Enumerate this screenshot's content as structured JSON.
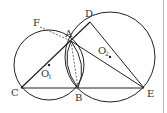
{
  "diagram": {
    "type": "geometry",
    "points": {
      "A": {
        "label": "A",
        "x": 71,
        "y": 41
      },
      "B": {
        "label": "B",
        "x": 78,
        "y": 88
      },
      "C": {
        "label": "C",
        "x": 21,
        "y": 88
      },
      "D": {
        "label": "D",
        "x": 90,
        "y": 22
      },
      "E": {
        "label": "E",
        "x": 144,
        "y": 88
      },
      "F": {
        "label": "F",
        "x": 40,
        "y": 23
      }
    },
    "centers": {
      "O1": {
        "label": "O",
        "sub": "1",
        "x": 49,
        "y": 65
      },
      "O2": {
        "label": "O",
        "sub": "2",
        "x": 110,
        "y": 57
      }
    },
    "circles": [
      {
        "name": "circle-O1",
        "cx": 49,
        "cy": 65,
        "r": 35
      },
      {
        "name": "circle-O2",
        "cx": 110,
        "cy": 57,
        "r": 45
      }
    ],
    "segments": [
      "CE",
      "CD",
      "AE",
      "DE"
    ],
    "dashed_segments": [
      "FA",
      "AB"
    ],
    "colors": {
      "stroke": "#222222",
      "text": "#333333"
    }
  }
}
